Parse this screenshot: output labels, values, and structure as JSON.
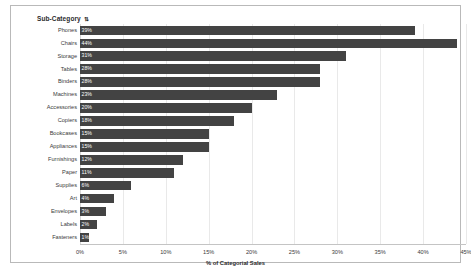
{
  "chart_title": "Sub-Category",
  "sort_glyph": "⇅",
  "chart_data": {
    "type": "bar",
    "orientation": "horizontal",
    "title": "Sub-Category",
    "xlabel": "% of Categorial Sales",
    "ylabel": "",
    "xlim": [
      0,
      45
    ],
    "grid": true,
    "legend": false,
    "bar_color": "#434343",
    "tick_labels": [
      "0%",
      "5%",
      "10%",
      "15%",
      "20%",
      "25%",
      "30%",
      "35%",
      "40%",
      "45%"
    ],
    "ticks": [
      0,
      5,
      10,
      15,
      20,
      25,
      30,
      35,
      40,
      45
    ],
    "categories": [
      "Phones",
      "Chairs",
      "Storage",
      "Tables",
      "Binders",
      "Machines",
      "Accessories",
      "Copiers",
      "Bookcases",
      "Appliances",
      "Furnishings",
      "Paper",
      "Supplies",
      "Art",
      "Envelopes",
      "Labels",
      "Fasteners"
    ],
    "values": [
      39,
      44,
      31,
      28,
      28,
      23,
      20,
      18,
      15,
      15,
      12,
      11,
      6,
      4,
      3,
      2,
      1
    ],
    "value_labels": [
      "39%",
      "44%",
      "31%",
      "28%",
      "28%",
      "23%",
      "20%",
      "18%",
      "15%",
      "15%",
      "12%",
      "11%",
      "6%",
      "4%",
      "3%",
      "2%",
      "1%"
    ]
  }
}
